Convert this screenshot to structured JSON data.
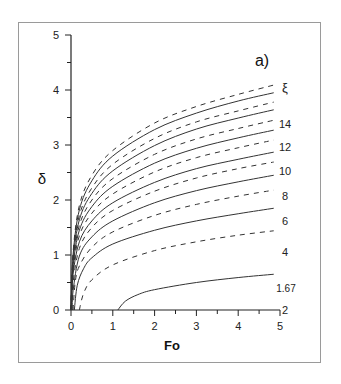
{
  "chart_data": {
    "type": "line",
    "panel_label": "a)",
    "title": "",
    "xlabel": "Fo",
    "ylabel": "δ",
    "xlim": [
      0,
      5
    ],
    "ylim": [
      0,
      5
    ],
    "xticks": [
      "0",
      "1",
      "2",
      "3",
      "4",
      "5"
    ],
    "yticks": [
      "0",
      "1",
      "2",
      "3",
      "4",
      "5"
    ],
    "grid": false,
    "legend_title": "ξ",
    "curve_labels": [
      "14",
      "12",
      "10",
      "8",
      "6",
      "4",
      "2",
      "1.67"
    ],
    "series": [
      {
        "name": "ξ=15",
        "style": "dashed",
        "start_fo": 0.0,
        "values_at": [
          [
            0.05,
            1.05
          ],
          [
            0.2,
            1.9
          ],
          [
            0.5,
            2.45
          ],
          [
            1,
            2.9
          ],
          [
            2,
            3.4
          ],
          [
            3,
            3.7
          ],
          [
            4,
            3.92
          ],
          [
            4.85,
            4.09
          ]
        ]
      },
      {
        "name": "ξ=14",
        "style": "solid",
        "start_fo": 0.0,
        "values_at": [
          [
            0.05,
            1.0
          ],
          [
            0.2,
            1.82
          ],
          [
            0.5,
            2.35
          ],
          [
            1,
            2.8
          ],
          [
            2,
            3.28
          ],
          [
            3,
            3.58
          ],
          [
            4,
            3.8
          ],
          [
            4.85,
            3.95
          ]
        ]
      },
      {
        "name": "ξ=13",
        "style": "dashed",
        "start_fo": 0.0,
        "values_at": [
          [
            0.05,
            0.95
          ],
          [
            0.2,
            1.72
          ],
          [
            0.5,
            2.22
          ],
          [
            1,
            2.65
          ],
          [
            2,
            3.12
          ],
          [
            3,
            3.42
          ],
          [
            4,
            3.62
          ],
          [
            4.85,
            3.78
          ]
        ]
      },
      {
        "name": "ξ=12",
        "style": "solid",
        "start_fo": 0.0,
        "values_at": [
          [
            0.05,
            0.9
          ],
          [
            0.2,
            1.64
          ],
          [
            0.5,
            2.12
          ],
          [
            1,
            2.53
          ],
          [
            2,
            2.99
          ],
          [
            3,
            3.29
          ],
          [
            4,
            3.49
          ],
          [
            4.85,
            3.64
          ]
        ]
      },
      {
        "name": "ξ=11",
        "style": "dashed",
        "start_fo": 0.0,
        "values_at": [
          [
            0.05,
            0.85
          ],
          [
            0.2,
            1.54
          ],
          [
            0.5,
            2.0
          ],
          [
            1,
            2.39
          ],
          [
            2,
            2.83
          ],
          [
            3,
            3.11
          ],
          [
            4,
            3.3
          ],
          [
            4.85,
            3.45
          ]
        ]
      },
      {
        "name": "ξ=10",
        "style": "solid",
        "start_fo": 0.0,
        "values_at": [
          [
            0.05,
            0.8
          ],
          [
            0.2,
            1.45
          ],
          [
            0.5,
            1.88
          ],
          [
            1,
            2.25
          ],
          [
            2,
            2.67
          ],
          [
            3,
            2.94
          ],
          [
            4,
            3.13
          ],
          [
            4.85,
            3.27
          ]
        ]
      },
      {
        "name": "ξ=9",
        "style": "dashed",
        "start_fo": 0.01,
        "values_at": [
          [
            0.05,
            0.72
          ],
          [
            0.2,
            1.35
          ],
          [
            0.5,
            1.76
          ],
          [
            1,
            2.11
          ],
          [
            2,
            2.51
          ],
          [
            3,
            2.77
          ],
          [
            4,
            2.95
          ],
          [
            4.85,
            3.09
          ]
        ]
      },
      {
        "name": "ξ=8",
        "style": "solid",
        "start_fo": 0.01,
        "values_at": [
          [
            0.05,
            0.65
          ],
          [
            0.2,
            1.24
          ],
          [
            0.5,
            1.62
          ],
          [
            1,
            1.95
          ],
          [
            2,
            2.32
          ],
          [
            3,
            2.57
          ],
          [
            4,
            2.74
          ],
          [
            4.85,
            2.87
          ]
        ]
      },
      {
        "name": "ξ=7",
        "style": "dashed",
        "start_fo": 0.02,
        "values_at": [
          [
            0.05,
            0.5
          ],
          [
            0.2,
            1.12
          ],
          [
            0.5,
            1.5
          ],
          [
            1,
            1.81
          ],
          [
            2,
            2.16
          ],
          [
            3,
            2.4
          ],
          [
            4,
            2.57
          ],
          [
            4.85,
            2.69
          ]
        ]
      },
      {
        "name": "ξ=6",
        "style": "solid",
        "start_fo": 0.03,
        "values_at": [
          [
            0.05,
            0.35
          ],
          [
            0.2,
            0.98
          ],
          [
            0.5,
            1.33
          ],
          [
            1,
            1.62
          ],
          [
            2,
            1.95
          ],
          [
            3,
            2.17
          ],
          [
            4,
            2.33
          ],
          [
            4.85,
            2.45
          ]
        ]
      },
      {
        "name": "ξ=5",
        "style": "dashed",
        "start_fo": 0.05,
        "values_at": [
          [
            0.1,
            0.5
          ],
          [
            0.2,
            0.8
          ],
          [
            0.5,
            1.14
          ],
          [
            1,
            1.42
          ],
          [
            2,
            1.72
          ],
          [
            3,
            1.92
          ],
          [
            4,
            2.07
          ],
          [
            4.85,
            2.18
          ]
        ]
      },
      {
        "name": "ξ=4",
        "style": "solid",
        "start_fo": 0.08,
        "values_at": [
          [
            0.15,
            0.45
          ],
          [
            0.3,
            0.75
          ],
          [
            0.5,
            0.95
          ],
          [
            1,
            1.2
          ],
          [
            2,
            1.45
          ],
          [
            3,
            1.62
          ],
          [
            4,
            1.75
          ],
          [
            4.85,
            1.85
          ]
        ]
      },
      {
        "name": "ξ=3",
        "style": "dashed",
        "start_fo": 0.2,
        "values_at": [
          [
            0.3,
            0.3
          ],
          [
            0.5,
            0.55
          ],
          [
            1,
            0.82
          ],
          [
            2,
            1.08
          ],
          [
            3,
            1.24
          ],
          [
            4,
            1.36
          ],
          [
            4.85,
            1.44
          ]
        ]
      },
      {
        "name": "ξ=2",
        "style": "solid",
        "start_fo": 1.12,
        "values_at": [
          [
            1.3,
            0.16
          ],
          [
            1.6,
            0.28
          ],
          [
            2,
            0.37
          ],
          [
            3,
            0.5
          ],
          [
            4,
            0.59
          ],
          [
            4.85,
            0.65
          ]
        ]
      },
      {
        "name": "ξ=1.67",
        "style": "solid",
        "start_fo": 5.0,
        "values_at": [
          [
            5,
            0
          ]
        ]
      }
    ]
  }
}
